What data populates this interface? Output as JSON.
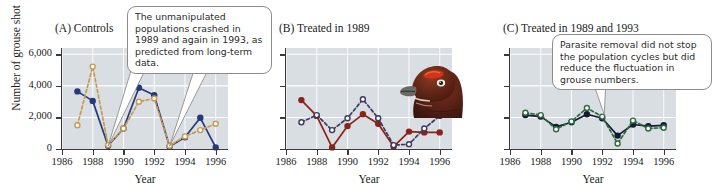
{
  "figure": {
    "y_axis_title": "Number of grouse shot",
    "x_axis_title": "Year",
    "y_ticks": [
      "0",
      "2,000",
      "4,000",
      "6,000"
    ],
    "x_ticks": [
      "1986",
      "1988",
      "1990",
      "1992",
      "1994",
      "1996"
    ],
    "plot_background": "#d9dee2",
    "gridline_color": "#ffffff"
  },
  "panels": [
    {
      "id": "A",
      "label": "(A)  Controls",
      "callout": "The unmanipulated populations crashed in 1989 and again in 1993, as predicted from long-term data.",
      "series": [
        {
          "name": "control-site-1",
          "style": "solid",
          "marker": "filled-circle",
          "color": "#253a7a",
          "x": [
            1987,
            1988,
            1989,
            1990,
            1991,
            1992,
            1993,
            1994,
            1995,
            1996
          ],
          "y": [
            3650,
            3050,
            200,
            1300,
            3880,
            3400,
            150,
            750,
            1980,
            100
          ]
        },
        {
          "name": "control-site-2",
          "style": "dashed",
          "marker": "open-circle",
          "color": "#c99a55",
          "x": [
            1987,
            1988,
            1989,
            1990,
            1991,
            1992,
            1993,
            1994,
            1995,
            1996
          ],
          "y": [
            1500,
            5220,
            250,
            1300,
            3000,
            3200,
            200,
            800,
            1200,
            1600
          ]
        }
      ]
    },
    {
      "id": "B",
      "label": "(B)  Treated in 1989",
      "callout": null,
      "series": [
        {
          "name": "treated-1989-site-1",
          "style": "solid",
          "marker": "filled-circle",
          "color": "#8b2318",
          "x": [
            1987,
            1988,
            1989,
            1990,
            1991,
            1992,
            1993,
            1994,
            1995,
            1996
          ],
          "y": [
            3100,
            2100,
            100,
            1450,
            2200,
            1600,
            150,
            1100,
            1050,
            1050
          ]
        },
        {
          "name": "treated-1989-site-2",
          "style": "dashed",
          "marker": "open-circle",
          "color": "#3f3a63",
          "x": [
            1987,
            1988,
            1989,
            1990,
            1991,
            1992,
            1993,
            1994,
            1995,
            1996
          ],
          "y": [
            1700,
            2150,
            1200,
            1950,
            3150,
            1950,
            250,
            300,
            1300,
            2100
          ]
        }
      ]
    },
    {
      "id": "C",
      "label": "(C)  Treated in 1989 and 1993",
      "callout": "Parasite removal did not stop the population cycles but did reduce the fluctuation in grouse numbers.",
      "series": [
        {
          "name": "treated-1989-1993-site-1",
          "style": "solid",
          "marker": "filled-circle",
          "color": "#141b36",
          "x": [
            1987,
            1988,
            1989,
            1990,
            1991,
            1992,
            1993,
            1994,
            1995,
            1996
          ],
          "y": [
            2150,
            2050,
            1400,
            1700,
            2200,
            1950,
            850,
            1550,
            1450,
            1500
          ]
        },
        {
          "name": "treated-1989-1993-site-2",
          "style": "dashed",
          "marker": "open-circle",
          "color": "#2e6b3f",
          "x": [
            1987,
            1988,
            1989,
            1990,
            1991,
            1992,
            1993,
            1994,
            1995,
            1996
          ],
          "y": [
            2300,
            2150,
            1250,
            1750,
            2600,
            2050,
            350,
            1800,
            1300,
            1350
          ]
        }
      ]
    }
  ],
  "illustration": {
    "name": "red-grouse-head",
    "eyebrow_color": "#d1341a",
    "body_color": "#5b2216"
  },
  "chart_data": {
    "type": "line",
    "title": "",
    "xlabel": "Year",
    "ylabel": "Number of grouse shot",
    "xlim": [
      1986,
      1996.8
    ],
    "ylim": [
      0,
      6400
    ],
    "yticks": [
      0,
      2000,
      4000,
      6000
    ],
    "xticks": [
      1986,
      1988,
      1990,
      1992,
      1994,
      1996
    ],
    "grid": true,
    "legend": "none",
    "panels": [
      {
        "panel": "A",
        "panel_title": "(A)  Controls",
        "x": [
          1987,
          1988,
          1989,
          1990,
          1991,
          1992,
          1993,
          1994,
          1995,
          1996
        ],
        "series": [
          {
            "name": "control-site-1",
            "values": [
              3650,
              3050,
              200,
              1300,
              3880,
              3400,
              150,
              750,
              1980,
              100
            ]
          },
          {
            "name": "control-site-2",
            "values": [
              1500,
              5220,
              250,
              1300,
              3000,
              3200,
              200,
              800,
              1200,
              1600
            ]
          }
        ]
      },
      {
        "panel": "B",
        "panel_title": "(B)  Treated in 1989",
        "x": [
          1987,
          1988,
          1989,
          1990,
          1991,
          1992,
          1993,
          1994,
          1995,
          1996
        ],
        "series": [
          {
            "name": "treated-1989-site-1",
            "values": [
              3100,
              2100,
              100,
              1450,
              2200,
              1600,
              150,
              1100,
              1050,
              1050
            ]
          },
          {
            "name": "treated-1989-site-2",
            "values": [
              1700,
              2150,
              1200,
              1950,
              3150,
              1950,
              250,
              300,
              1300,
              2100
            ]
          }
        ]
      },
      {
        "panel": "C",
        "panel_title": "(C)  Treated in 1989 and 1993",
        "x": [
          1987,
          1988,
          1989,
          1990,
          1991,
          1992,
          1993,
          1994,
          1995,
          1996
        ],
        "series": [
          {
            "name": "treated-1989-1993-site-1",
            "values": [
              2150,
              2050,
              1400,
              1700,
              2200,
              1950,
              850,
              1550,
              1450,
              1500
            ]
          },
          {
            "name": "treated-1989-1993-site-2",
            "values": [
              2300,
              2150,
              1250,
              1750,
              2600,
              2050,
              350,
              1800,
              1300,
              1350
            ]
          }
        ]
      }
    ],
    "annotations": [
      "The unmanipulated populations crashed in 1989 and again in 1993, as predicted from long-term data.",
      "Parasite removal did not stop the population cycles but did reduce the fluctuation in grouse numbers."
    ]
  }
}
